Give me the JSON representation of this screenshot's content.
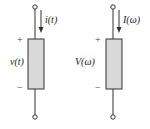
{
  "diagram": {
    "left": {
      "current_label": "i(t)",
      "voltage_label": "v(t)",
      "plus": "+",
      "minus": "−"
    },
    "right": {
      "current_label": "I(ω)",
      "voltage_label": "V(ω)",
      "plus": "+",
      "minus": "−"
    },
    "colors": {
      "element_fill": "#d9d9d9",
      "line": "#333333"
    }
  }
}
